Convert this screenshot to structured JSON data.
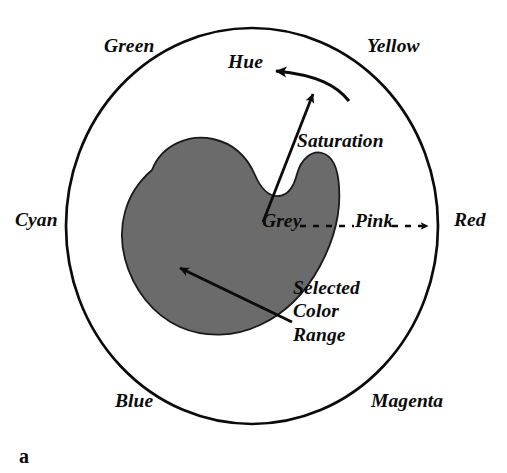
{
  "figure": {
    "panel_letter": "a",
    "type": "hue-saturation-color-wheel-diagram",
    "background_color": "#ffffff",
    "ink_color": "#0b0b0b",
    "blob_fill_color": "#6b6b6b",
    "blob_stroke_color": "#111111"
  },
  "wheel": {
    "outline_shape": "circle",
    "center": {
      "x": 252,
      "y": 226
    },
    "radius_x": 186,
    "radius_y": 198,
    "stroke_width": 2.6,
    "hue_labels": [
      {
        "name": "green",
        "text": "Green",
        "angle_deg": 120,
        "position": "outside-upper-left"
      },
      {
        "name": "yellow",
        "text": "Yellow",
        "angle_deg": 60,
        "position": "outside-upper-right"
      },
      {
        "name": "cyan",
        "text": "Cyan",
        "angle_deg": 180,
        "position": "outside-left"
      },
      {
        "name": "red",
        "text": "Red",
        "angle_deg": 0,
        "position": "outside-right"
      },
      {
        "name": "blue",
        "text": "Blue",
        "angle_deg": 240,
        "position": "outside-lower-left"
      },
      {
        "name": "magenta",
        "text": "Magenta",
        "angle_deg": 300,
        "position": "outside-lower-right"
      }
    ]
  },
  "annotations": {
    "hue": {
      "label": "Hue",
      "arrow": "curved-arrow-counterclockwise",
      "arrow_tail": {
        "x": 348,
        "y": 99
      },
      "arrow_head": {
        "x": 266,
        "y": 70
      }
    },
    "saturation": {
      "label": "Saturation",
      "arrow": "straight-arrow-outward",
      "arrow_tail": {
        "x": 263,
        "y": 222
      },
      "arrow_head": {
        "x": 314,
        "y": 88
      }
    },
    "radius_axis": {
      "center_label": "Grey",
      "mid_label": "Pink",
      "edge_label": "Red",
      "line_style": "dashed",
      "arrow_head": {
        "x": 434,
        "y": 226
      }
    },
    "selected_region": {
      "lines": [
        "Selected",
        "Color",
        "Range"
      ],
      "arrow": "straight-arrow-to-blob",
      "arrow_tail": {
        "x": 291,
        "y": 321
      },
      "arrow_head": {
        "x": 177,
        "y": 266
      }
    }
  }
}
